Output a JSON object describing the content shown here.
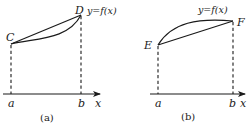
{
  "panels": [
    {
      "caption": "(a)",
      "function_label": "y=f(x)",
      "axis_label": "x",
      "ticks": [
        "a",
        "b"
      ],
      "points": [
        {
          "name": "C",
          "at": "a"
        },
        {
          "name": "D",
          "at": "b"
        }
      ],
      "curve_shape": "convex (curve below chord CD)"
    },
    {
      "caption": "(b)",
      "function_label": "y=f(x)",
      "axis_label": "x",
      "ticks": [
        "a",
        "b"
      ],
      "points": [
        {
          "name": "E",
          "at": "a"
        },
        {
          "name": "F",
          "at": "b"
        }
      ],
      "curve_shape": "concave (curve above chord EF)"
    }
  ],
  "colors": {
    "ink": "#1a1a1a",
    "background": "#ffffff"
  }
}
